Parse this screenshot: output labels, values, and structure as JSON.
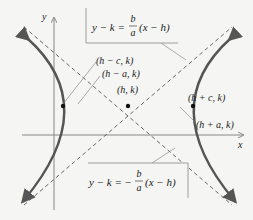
{
  "diagram": {
    "axes": {
      "x_label": "x",
      "y_label": "y"
    },
    "points": [
      {
        "id": "focus-left",
        "label": "(h − c, k)"
      },
      {
        "id": "vertex-left",
        "label": "(h − a, k)"
      },
      {
        "id": "center",
        "label": "(h, k)"
      },
      {
        "id": "focus-right",
        "label": "(h + c, k)"
      },
      {
        "id": "vertex-right",
        "label": "(h + a, k)"
      }
    ],
    "asymptotes": {
      "upper": {
        "lhs": "y − k =",
        "num": "b",
        "den": "a",
        "rhs": "(x − h)"
      },
      "lower": {
        "lhs": "y − k = −",
        "num": "b",
        "den": "a",
        "rhs": "(x − h)"
      }
    },
    "colors": {
      "curve": "#555555",
      "asymptote": "#444444",
      "axis": "#888888",
      "background": "#f5f5f3"
    }
  }
}
